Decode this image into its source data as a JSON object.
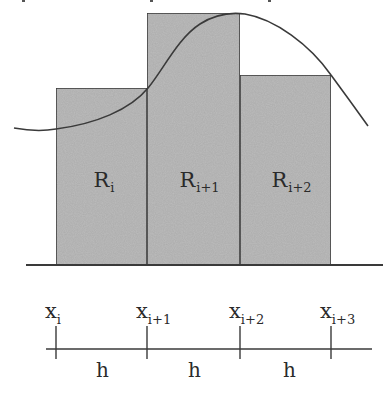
{
  "figure": {
    "title_cutoff": "",
    "colors": {
      "background": "#ffffff",
      "rect_fill": "#bcbcbc",
      "rect_stroke": "#3c3c3c",
      "curve": "#3a3a3a",
      "axis": "#3a3a3a",
      "text": "#2a2a2a"
    },
    "rectangles": [
      {
        "label": "R",
        "sub": "i",
        "x": 56,
        "y": 88,
        "width": 91,
        "height": 177
      },
      {
        "label": "R",
        "sub": "i+1",
        "x": 147,
        "y": 13,
        "width": 93,
        "height": 252
      },
      {
        "label": "R",
        "sub": "i+2",
        "x": 240,
        "y": 75,
        "width": 91,
        "height": 190
      }
    ],
    "baseline": {
      "x1": 26,
      "x2": 383,
      "y": 265
    },
    "curve_path": "M14,128 C30,131 45,131 56,129 C95,124 130,110 148,88 C163,70 178,38 200,24 C214,15 230,12 245,14 C275,19 310,45 331,75 C345,94 358,112 368,126"
  },
  "number_line": {
    "axis": {
      "x1": 46,
      "x2": 372,
      "y": 349
    },
    "ticks": [
      {
        "x": 56,
        "label": "x",
        "sub": "i"
      },
      {
        "x": 147,
        "label": "x",
        "sub": "i+1"
      },
      {
        "x": 240,
        "label": "x",
        "sub": "i+2"
      },
      {
        "x": 331,
        "label": "x",
        "sub": "i+3"
      }
    ],
    "intervals": [
      {
        "label": "h",
        "x": 96
      },
      {
        "label": "h",
        "x": 188
      },
      {
        "label": "h",
        "x": 283
      }
    ]
  }
}
